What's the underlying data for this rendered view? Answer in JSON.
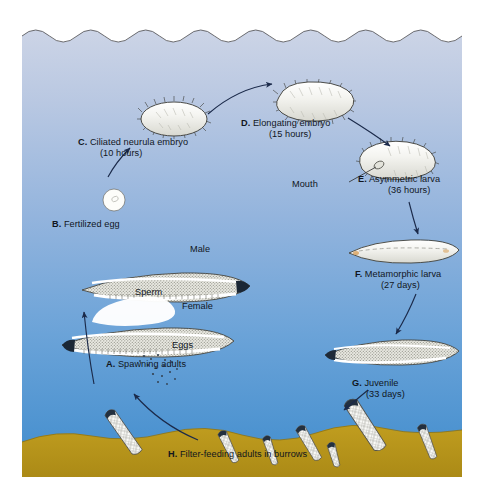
{
  "figure": {
    "panel": {
      "x": 22,
      "y": 22,
      "width": 440,
      "height": 455
    },
    "colors": {
      "page_background": "#ffffff",
      "water_top": "#ccd4e6",
      "water_mid": "#8eb2dc",
      "water_bottom": "#3f8ccd",
      "sand": "#b8941c",
      "sand_shadow": "#9c7c14",
      "organism_fill": "#fdfdfb",
      "organism_outline": "#2b2b2b",
      "juvenile_stipple": "#9b9b93",
      "arrow": "#1b2a4a",
      "text": "#11161d",
      "frame": "#8d8d8d"
    },
    "water_surface": "scalloped-wave-edge",
    "seafloor": "undulating-sand-bed"
  },
  "stages": [
    {
      "key": "A",
      "letter": "A.",
      "title": "Spawning adults",
      "time": "",
      "label_x": 84,
      "label_y": 337,
      "align": "left"
    },
    {
      "key": "B",
      "letter": "B.",
      "title": "Fertilized egg",
      "time": "",
      "label_x": 30,
      "label_y": 197,
      "align": "left"
    },
    {
      "key": "C",
      "letter": "C.",
      "title": "Ciliated neurula embryo",
      "time": "(10 hours)",
      "label_x": 56,
      "label_y": 115,
      "align": "left"
    },
    {
      "key": "D",
      "letter": "D.",
      "title": "Elongating embryo",
      "time": "(15 hours)",
      "label_x": 219,
      "label_y": 96,
      "align": "left"
    },
    {
      "key": "E",
      "letter": "E.",
      "title": "Asymmetric larva",
      "time": "(36 hours)",
      "label_x": 355,
      "label_y": 152,
      "align": "left"
    },
    {
      "key": "F",
      "letter": "F.",
      "title": "Metamorphic larva",
      "time": "(27 days)",
      "label_x": 357,
      "label_y": 247,
      "align": "left"
    },
    {
      "key": "G",
      "letter": "G.",
      "title": "Juvenile",
      "time": "(33 days)",
      "label_x": 352,
      "label_y": 356,
      "align": "left"
    },
    {
      "key": "H",
      "letter": "H.",
      "title": "Filter-feeding adults in burrows",
      "time": "",
      "label_x": 186,
      "label_y": 455,
      "align": "left"
    }
  ],
  "annotations": [
    {
      "key": "male",
      "text": "Male",
      "x": 182,
      "y": 245
    },
    {
      "key": "sperm",
      "text": "Sperm",
      "x": 129,
      "y": 288
    },
    {
      "key": "female",
      "text": "Female",
      "x": 176,
      "y": 302
    },
    {
      "key": "eggs",
      "text": "Eggs",
      "x": 162,
      "y": 343
    },
    {
      "key": "mouth",
      "text": "Mouth",
      "x": 278,
      "y": 166
    }
  ],
  "arrows": [
    {
      "from": "H-burrows",
      "to": "A-spawning-adults"
    },
    {
      "from": "A-spawning-adults",
      "to": "B-fertilized-egg"
    },
    {
      "from": "B-fertilized-egg",
      "to": "C-ciliated-neurula-embryo"
    },
    {
      "from": "C-ciliated-neurula-embryo",
      "to": "D-elongating-embryo"
    },
    {
      "from": "D-elongating-embryo",
      "to": "E-asymmetric-larva"
    },
    {
      "from": "E-asymmetric-larva",
      "to": "F-metamorphic-larva"
    },
    {
      "from": "F-metamorphic-larva",
      "to": "G-juvenile"
    },
    {
      "from": "G-juvenile",
      "to": "H-burrows"
    }
  ],
  "organisms": {
    "fertilized_egg": {
      "shape": "small-white-circle",
      "cx": 92,
      "cy": 178,
      "r": 11
    },
    "ciliated_neurula_embryo": {
      "shape": "ciliated-oval",
      "cx": 152,
      "cy": 97
    },
    "elongating_embryo": {
      "shape": "ciliated-elongate-oval",
      "cx": 293,
      "cy": 78
    },
    "asymmetric_larva": {
      "shape": "curved-ciliated-larva-with-mouth",
      "cx": 374,
      "cy": 143
    },
    "metamorphic_larva": {
      "shape": "slender-lancet",
      "cx": 389,
      "cy": 230
    },
    "juvenile": {
      "shape": "stippled-lancelet",
      "cx": 378,
      "cy": 332
    },
    "adult_male": {
      "shape": "stippled-lancelet",
      "cx": 148,
      "cy": 267
    },
    "adult_female": {
      "shape": "stippled-lancelet",
      "cx": 128,
      "cy": 322
    },
    "sperm_cloud": {
      "shape": "white-plume",
      "cx": 120,
      "cy": 290
    },
    "egg_cloud": {
      "shape": "speckle-cloud",
      "cx": 140,
      "cy": 330
    },
    "burrow_adults_count": 7
  }
}
